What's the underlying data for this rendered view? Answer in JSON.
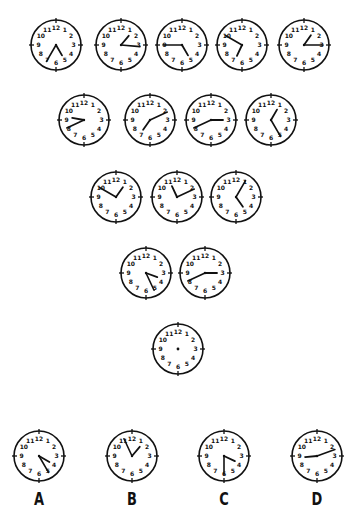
{
  "puzzle": {
    "radius": 25,
    "hand_color": "#111111",
    "face_color": "#ffffff",
    "numerals": [
      "12",
      "1",
      "2",
      "3",
      "4",
      "5",
      "6",
      "7",
      "8",
      "9",
      "10",
      "11"
    ],
    "rows": [
      {
        "name": "row-1",
        "clocks": [
          {
            "cx": 56,
            "cy": 45,
            "minute_deg": 210,
            "hour_deg": 150
          },
          {
            "cx": 121,
            "cy": 45,
            "minute_deg": 95,
            "hour_deg": 40
          },
          {
            "cx": 182,
            "cy": 45,
            "minute_deg": 270,
            "hour_deg": 150
          },
          {
            "cx": 242,
            "cy": 45,
            "minute_deg": 300,
            "hour_deg": 205
          },
          {
            "cx": 304,
            "cy": 45,
            "minute_deg": 90,
            "hour_deg": 35
          }
        ]
      },
      {
        "name": "row-2",
        "clocks": [
          {
            "cx": 84,
            "cy": 120,
            "minute_deg": 245,
            "hour_deg": 280
          },
          {
            "cx": 150,
            "cy": 120,
            "minute_deg": 65,
            "hour_deg": 215
          },
          {
            "cx": 211,
            "cy": 120,
            "minute_deg": 245,
            "hour_deg": 90
          },
          {
            "cx": 271,
            "cy": 120,
            "minute_deg": 150,
            "hour_deg": 30
          }
        ]
      },
      {
        "name": "row-3",
        "clocks": [
          {
            "cx": 116,
            "cy": 197,
            "minute_deg": 300,
            "hour_deg": 35
          },
          {
            "cx": 177,
            "cy": 197,
            "minute_deg": 65,
            "hour_deg": 335
          },
          {
            "cx": 236,
            "cy": 197,
            "minute_deg": 30,
            "hour_deg": 145
          }
        ]
      },
      {
        "name": "row-4",
        "clocks": [
          {
            "cx": 146,
            "cy": 273,
            "minute_deg": 155,
            "hour_deg": 110
          },
          {
            "cx": 205,
            "cy": 273,
            "minute_deg": 245,
            "hour_deg": 90
          }
        ]
      },
      {
        "name": "row-5",
        "clocks": [
          {
            "cx": 178,
            "cy": 349,
            "minute_deg": null,
            "hour_deg": null,
            "blank": true
          }
        ]
      }
    ],
    "options": [
      {
        "label": "A",
        "cx": 39,
        "cy": 456,
        "minute_deg": 150,
        "hour_deg": 120
      },
      {
        "label": "B",
        "cx": 132,
        "cy": 456,
        "minute_deg": 335,
        "hour_deg": 40
      },
      {
        "label": "C",
        "cx": 224,
        "cy": 456,
        "minute_deg": 180,
        "hour_deg": 115
      },
      {
        "label": "D",
        "cx": 317,
        "cy": 456,
        "minute_deg": 70,
        "hour_deg": 265
      }
    ],
    "label_y": 488
  }
}
